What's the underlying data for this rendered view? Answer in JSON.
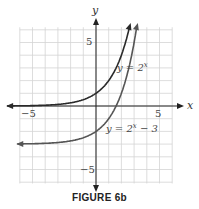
{
  "chart_data": {
    "type": "line",
    "title": "",
    "caption": "FIGURE 6b",
    "xlabel": "x",
    "ylabel": "y",
    "xlim": [
      -6,
      6
    ],
    "ylim": [
      -6,
      6
    ],
    "grid": true,
    "x_ticks_labeled": [
      "-5",
      "5"
    ],
    "y_ticks_labeled": [
      "5",
      "-5"
    ],
    "series": [
      {
        "name": "y = 2^x",
        "label": "y = 2ˣ",
        "color": "#2a2a2a",
        "x": [
          -6,
          -4,
          -2,
          -1,
          0,
          1,
          2,
          2.6
        ],
        "values": [
          0.016,
          0.0625,
          0.25,
          0.5,
          1,
          2,
          4,
          6.06
        ]
      },
      {
        "name": "y = 2^x - 3",
        "label": "y = 2ˣ − 3",
        "color": "#555555",
        "x": [
          -6,
          -4,
          -2,
          -1,
          0,
          1,
          2,
          3.1
        ],
        "values": [
          -2.98,
          -2.94,
          -2.75,
          -2.5,
          -2,
          -1,
          1,
          5.57
        ]
      }
    ]
  },
  "labels": {
    "x_axis": "x",
    "y_axis": "y",
    "tick_x_neg5": "−5",
    "tick_x_5": "5",
    "tick_y_5": "5",
    "tick_y_neg5": "−5",
    "curve1": "y = 2",
    "curve1_exp": "x",
    "curve2": "y = 2",
    "curve2_exp": "x",
    "curve2_tail": " − 3",
    "caption": "FIGURE 6b"
  }
}
